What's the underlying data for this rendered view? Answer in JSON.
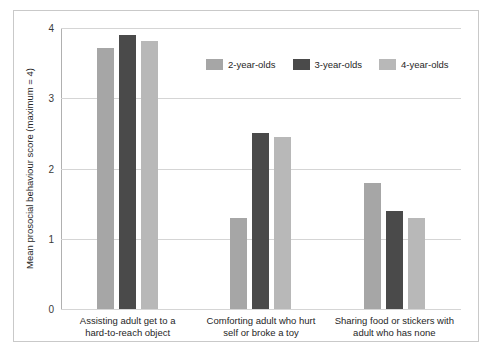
{
  "chart_data": {
    "type": "bar",
    "title": "",
    "subtitle": "",
    "xlabel": "",
    "ylabel": "Mean prosocial behaviour score (maximum = 4)",
    "ylim": [
      0,
      4
    ],
    "yticks": [
      "0",
      "1",
      "2",
      "3",
      "4"
    ],
    "grid": true,
    "legend_position": "top-center",
    "categories": [
      "Assisting adult get to a\nhard-to-reach object",
      "Comforting adult who hurt\nself or broke a toy",
      "Sharing food or stickers with\nadult who has none"
    ],
    "series": [
      {
        "name": "2-year-olds",
        "color": "#a6a6a6",
        "values": [
          3.72,
          1.3,
          1.8
        ]
      },
      {
        "name": "3-year-olds",
        "color": "#4a4a4a",
        "values": [
          3.9,
          2.5,
          1.4
        ]
      },
      {
        "name": "4-year-olds",
        "color": "#b8b8b8",
        "values": [
          3.82,
          2.45,
          1.3
        ]
      }
    ]
  }
}
